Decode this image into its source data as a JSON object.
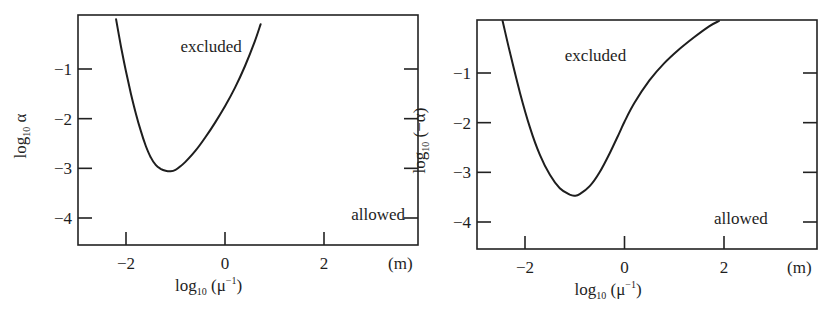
{
  "chart_data": [
    {
      "type": "line",
      "panel": "left",
      "title": "",
      "xlabel": "log10 (μ^-1)",
      "xlabel_parts": {
        "base": "log",
        "sub": "10",
        "arg": " (μ",
        "sup": "−1",
        "close": ")"
      },
      "ylabel": "log10 α",
      "ylabel_parts": {
        "base": "log",
        "sub": "10",
        "arg": " α"
      },
      "x_unit": "(m)",
      "xlim": [
        -2.95,
        3.95
      ],
      "ylim": [
        -4.55,
        0.1
      ],
      "xticks": [
        -2,
        0,
        2
      ],
      "xtick_labels": [
        "−2",
        "0",
        "2"
      ],
      "yticks": [
        -1,
        -2,
        -3,
        -4
      ],
      "ytick_labels": [
        "−1",
        "−2",
        "−3",
        "−4"
      ],
      "grid": false,
      "annotations": [
        {
          "text": "excluded",
          "x": -0.9,
          "y": -0.65
        },
        {
          "text": "allowed",
          "x": 2.55,
          "y": -4.05
        }
      ],
      "series": [
        {
          "name": "exclusion boundary",
          "x": [
            -2.2,
            -2.1,
            -2.0,
            -1.9,
            -1.8,
            -1.7,
            -1.6,
            -1.5,
            -1.4,
            -1.3,
            -1.2,
            -1.1,
            -1.0,
            -0.9,
            -0.8,
            -0.6,
            -0.4,
            -0.2,
            0.0,
            0.2,
            0.4,
            0.6,
            0.72
          ],
          "y": [
            0.0,
            -0.55,
            -1.05,
            -1.5,
            -1.9,
            -2.25,
            -2.55,
            -2.78,
            -2.93,
            -3.01,
            -3.05,
            -3.06,
            -3.03,
            -2.96,
            -2.87,
            -2.65,
            -2.38,
            -2.08,
            -1.75,
            -1.38,
            -0.95,
            -0.45,
            -0.1
          ]
        }
      ]
    },
    {
      "type": "line",
      "panel": "right",
      "title": "",
      "xlabel": "log10 (μ^-1)",
      "xlabel_parts": {
        "base": "log",
        "sub": "10",
        "arg": " (μ",
        "sup": "−1",
        "close": ")"
      },
      "ylabel": "log10 (−α)",
      "ylabel_parts": {
        "base": "log",
        "sub": "10",
        "arg": " (−α)"
      },
      "x_unit": "(m)",
      "xlim": [
        -2.95,
        3.95
      ],
      "ylim": [
        -4.55,
        0.1
      ],
      "xticks": [
        -2,
        0,
        2
      ],
      "xtick_labels": [
        "−2",
        "0",
        "2"
      ],
      "yticks": [
        -1,
        -2,
        -3,
        -4
      ],
      "ytick_labels": [
        "−1",
        "−2",
        "−3",
        "−4"
      ],
      "grid": false,
      "annotations": [
        {
          "text": "excluded",
          "x": -1.2,
          "y": -0.75
        },
        {
          "text": "allowed",
          "x": 1.8,
          "y": -4.05
        }
      ],
      "series": [
        {
          "name": "exclusion boundary",
          "x": [
            -2.45,
            -2.3,
            -2.1,
            -1.9,
            -1.7,
            -1.5,
            -1.3,
            -1.1,
            -1.0,
            -0.9,
            -0.7,
            -0.5,
            -0.3,
            -0.1,
            0.0,
            0.2,
            0.5,
            0.8,
            1.1,
            1.4,
            1.7,
            1.9
          ],
          "y": [
            0.1,
            -0.6,
            -1.4,
            -2.1,
            -2.65,
            -3.05,
            -3.32,
            -3.45,
            -3.47,
            -3.44,
            -3.28,
            -3.0,
            -2.62,
            -2.2,
            -1.98,
            -1.6,
            -1.15,
            -0.8,
            -0.52,
            -0.28,
            -0.06,
            0.05
          ]
        }
      ]
    }
  ],
  "layout_frames": [
    {
      "left": 78,
      "top": 15,
      "right": 418,
      "bottom": 245,
      "x_at": {
        "-2": 126,
        "2": 324
      },
      "y_at": {
        "-1": 69,
        "-4": 218
      }
    },
    {
      "left": 477,
      "top": 20,
      "right": 817,
      "bottom": 249,
      "x_at": {
        "-2": 525,
        "2": 724
      },
      "y_at": {
        "-1": 73,
        "-4": 222
      }
    }
  ]
}
